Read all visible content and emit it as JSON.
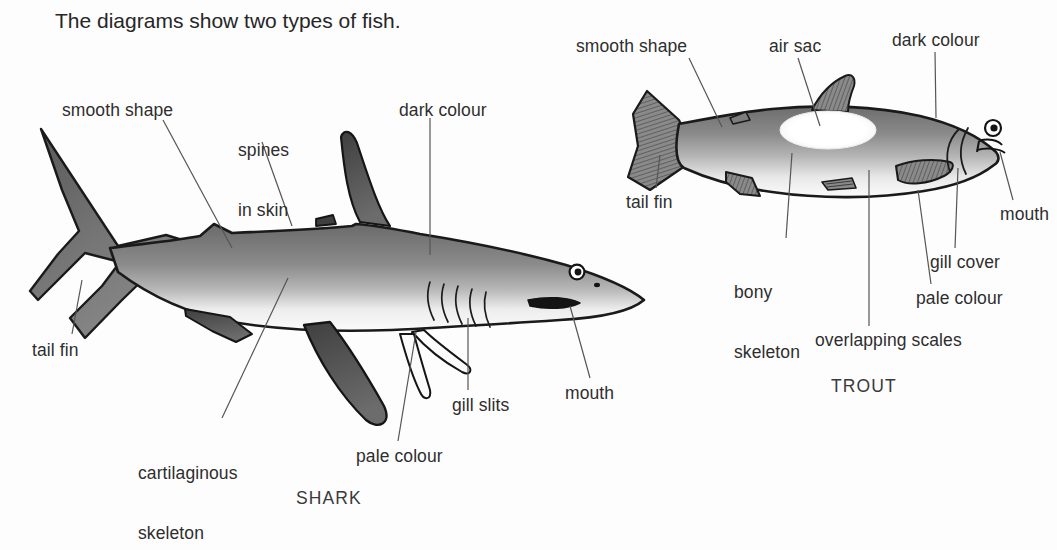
{
  "page": {
    "title": "The diagrams show two types of fish.",
    "background_color": "#fdfdfd",
    "ink_color": "#2e2e2e"
  },
  "figures": [
    {
      "name": "shark",
      "caption": "SHARK",
      "labels": [
        {
          "key": "smooth_shape",
          "text": "smooth shape"
        },
        {
          "key": "spines_in_skin",
          "line1": "spines",
          "line2": "in skin"
        },
        {
          "key": "dark_colour",
          "text": "dark colour"
        },
        {
          "key": "tail_fin",
          "text": "tail fin"
        },
        {
          "key": "cartilaginous_skeleton",
          "line1": "cartilaginous",
          "line2": "skeleton"
        },
        {
          "key": "pale_colour",
          "text": "pale colour"
        },
        {
          "key": "gill_slits",
          "text": "gill slits"
        },
        {
          "key": "mouth",
          "text": "mouth"
        }
      ]
    },
    {
      "name": "trout",
      "caption": "TROUT",
      "labels": [
        {
          "key": "smooth_shape",
          "text": "smooth shape"
        },
        {
          "key": "air_sac",
          "text": "air sac"
        },
        {
          "key": "dark_colour",
          "text": "dark colour"
        },
        {
          "key": "tail_fin",
          "text": "tail fin"
        },
        {
          "key": "bony_skeleton",
          "line1": "bony",
          "line2": "skeleton"
        },
        {
          "key": "overlapping_scales",
          "text": "overlapping scales"
        },
        {
          "key": "pale_colour",
          "text": "pale colour"
        },
        {
          "key": "gill_cover",
          "text": "gill cover"
        },
        {
          "key": "mouth",
          "text": "mouth"
        }
      ]
    }
  ],
  "colors": {
    "body_dark": "#6e6e6e",
    "body_mid": "#8d8d8d",
    "body_pale": "#f4f4f4",
    "fin_dark": "#4a4a4a",
    "outline": "#1a1a1a",
    "leader_line": "#555555",
    "air_sac": "#ffffff"
  }
}
